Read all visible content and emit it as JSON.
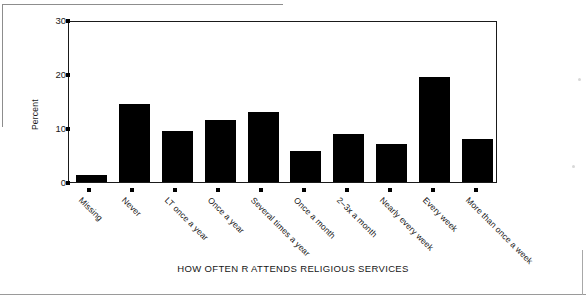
{
  "chart_data": {
    "type": "bar",
    "title": "",
    "xlabel": "HOW OFTEN R ATTENDS RELIGIOUS SERVICES",
    "ylabel": "Percent",
    "ylim": [
      0,
      30
    ],
    "yticks": [
      0,
      10,
      20,
      30
    ],
    "ytick_labels": [
      "0",
      "10",
      "20",
      "30"
    ],
    "grid": false,
    "legend": null,
    "bar_color": "#000000",
    "categories": [
      "Missing",
      "Never",
      "LT once a year",
      "Once a year",
      "Several times a year",
      "Once a month",
      "2-3x a month",
      "Nearly every week",
      "Every week",
      "More than once a week"
    ],
    "values": [
      1.3,
      14.4,
      9.5,
      11.5,
      13.0,
      5.7,
      8.8,
      7.1,
      19.4,
      8.0
    ]
  },
  "axes": {
    "y_label": "Percent",
    "y_tick_labels": [
      "30",
      "20",
      "10",
      "0"
    ],
    "x_axis_title": "HOW OFTEN R ATTENDS RELIGIOUS SERVICES"
  }
}
